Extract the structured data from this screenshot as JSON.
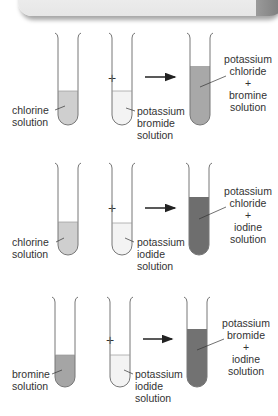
{
  "reactions": [
    {
      "reactant1": {
        "label_lines": [
          "chlorine",
          "solution"
        ],
        "color": "#cfcfcf"
      },
      "operator": "+",
      "reactant2": {
        "label_lines": [
          "potassium",
          "bromide",
          "solution"
        ],
        "color": "#f3f3f3"
      },
      "arrow": "→",
      "product": {
        "label_lines": [
          "potassium",
          "chloride",
          "+",
          "bromine",
          "solution"
        ],
        "color": "#a8a8a8"
      }
    },
    {
      "reactant1": {
        "label_lines": [
          "chlorine",
          "solution"
        ],
        "color": "#cfcfcf"
      },
      "operator": "+",
      "reactant2": {
        "label_lines": [
          "potassium",
          "iodide",
          "solution"
        ],
        "color": "#f3f3f3"
      },
      "arrow": "→",
      "product": {
        "label_lines": [
          "potassium",
          "chloride",
          "+",
          "iodine",
          "solution"
        ],
        "color": "#6e6e6e"
      }
    },
    {
      "reactant1": {
        "label_lines": [
          "bromine",
          "solution"
        ],
        "color": "#a5a5a5"
      },
      "operator": "+",
      "reactant2": {
        "label_lines": [
          "potassium",
          "iodide",
          "solution"
        ],
        "color": "#f3f3f3"
      },
      "arrow": "→",
      "product": {
        "label_lines": [
          "potassium",
          "bromide",
          "+",
          "iodine",
          "solution"
        ],
        "color": "#727272"
      }
    }
  ]
}
